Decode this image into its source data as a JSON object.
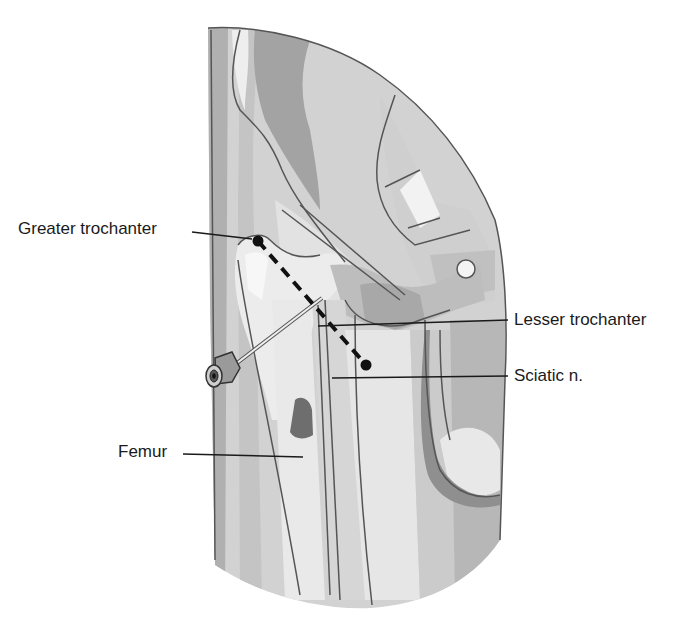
{
  "diagram": {
    "type": "anatomical-illustration",
    "labels": {
      "greater_trochanter": "Greater trochanter",
      "lesser_trochanter": "Lesser trochanter",
      "sciatic_nerve": "Sciatic n.",
      "femur": "Femur"
    },
    "landmarks": {
      "greater_trochanter_point": {
        "x": 258,
        "y": 241
      },
      "needle_target_point": {
        "x": 366,
        "y": 365
      }
    },
    "colors": {
      "background": "#ffffff",
      "outline": "#555555",
      "light_gray": "#e4e4e4",
      "mid_gray": "#c8c8c8",
      "dark_gray": "#a8a8a8",
      "darker_gray": "#8c8c8c",
      "leader_line": "#1a1a1a"
    }
  }
}
